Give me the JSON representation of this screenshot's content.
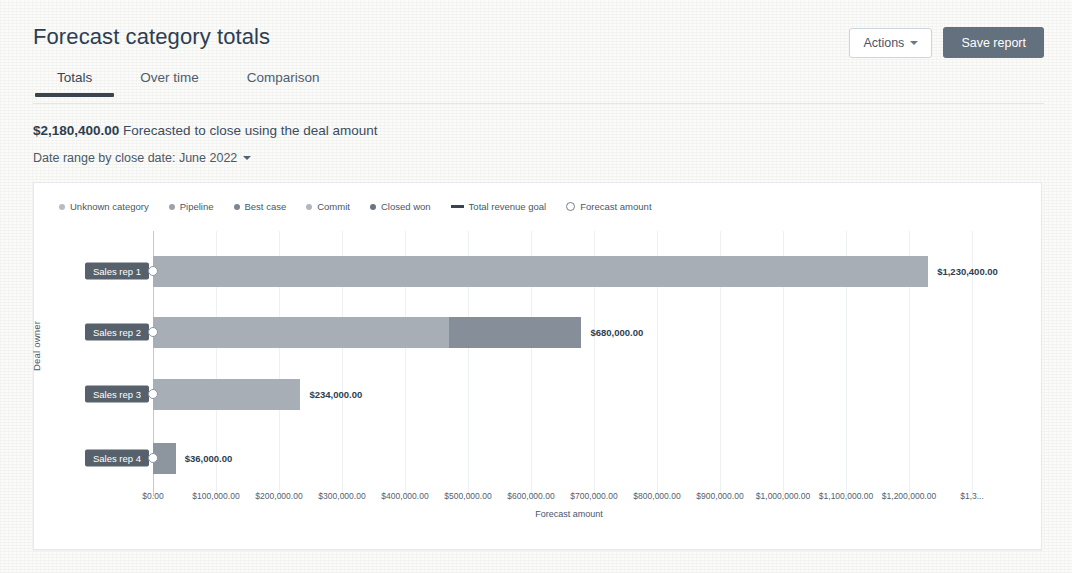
{
  "header": {
    "title": "Forecast category totals",
    "actions_label": "Actions",
    "save_label": "Save report"
  },
  "tabs": [
    {
      "label": "Totals",
      "active": true
    },
    {
      "label": "Over time",
      "active": false
    },
    {
      "label": "Comparison",
      "active": false
    }
  ],
  "summary": {
    "amount": "$2,180,400.00",
    "text": " Forecasted to close using the deal amount",
    "date_range_label": "Date range by close date: June 2022"
  },
  "chart_data": {
    "type": "bar",
    "orientation": "horizontal",
    "title": "",
    "xlabel": "Forecast amount",
    "ylabel": "Deal owner",
    "xlim": [
      0,
      1300000
    ],
    "grid": true,
    "legend_position": "top-left",
    "categories": [
      "Sales rep 1",
      "Sales rep 2",
      "Sales rep 3",
      "Sales rep 4"
    ],
    "values": [
      1230400,
      680000,
      234000,
      36000
    ],
    "value_labels": [
      "$1,230,400.00",
      "$680,000.00",
      "$234,000.00",
      "$36,000.00"
    ],
    "tick_labels": [
      "$0.00",
      "$100,000.00",
      "$200,000.00",
      "$300,000.00",
      "$400,000.00",
      "$500,000.00",
      "$600,000.00",
      "$700,000.00",
      "$800,000.00",
      "$900,000.00",
      "$1,000,000.00",
      "$1,100,000.00",
      "$1,200,000.00",
      "$1,3..."
    ],
    "tick_values": [
      0,
      100000,
      200000,
      300000,
      400000,
      500000,
      600000,
      700000,
      800000,
      900000,
      1000000,
      1100000,
      1200000,
      1300000
    ],
    "legend": [
      {
        "label": "Unknown category",
        "marker": "dot",
        "color": "#b6bcc3"
      },
      {
        "label": "Pipeline",
        "marker": "dot",
        "color": "#9aa2ab"
      },
      {
        "label": "Best case",
        "marker": "dot",
        "color": "#7d8691"
      },
      {
        "label": "Commit",
        "marker": "dot",
        "color": "#b0b7bf"
      },
      {
        "label": "Closed won",
        "marker": "dot",
        "color": "#6a7580"
      },
      {
        "label": "Total revenue goal",
        "marker": "line",
        "color": "#39444f"
      },
      {
        "label": "Forecast amount",
        "marker": "ring",
        "color": "#70808f"
      }
    ],
    "series": [
      {
        "category": "Sales rep 1",
        "segments": [
          {
            "name": "Pipeline",
            "value": 1230400,
            "color": "#a7aeb6"
          }
        ]
      },
      {
        "category": "Sales rep 2",
        "segments": [
          {
            "name": "Pipeline",
            "value": 470000,
            "color": "#a7aeb6"
          },
          {
            "name": "Best case",
            "value": 210000,
            "color": "#868f99"
          }
        ]
      },
      {
        "category": "Sales rep 3",
        "segments": [
          {
            "name": "Pipeline",
            "value": 234000,
            "color": "#a7aeb6"
          }
        ]
      },
      {
        "category": "Sales rep 4",
        "segments": [
          {
            "name": "Closed won",
            "value": 36000,
            "color": "#8d959e"
          }
        ]
      }
    ]
  }
}
